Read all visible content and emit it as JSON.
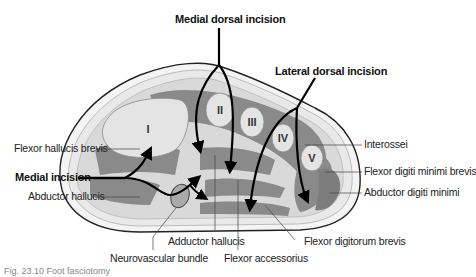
{
  "figure": {
    "caption": "Fig. 23.10 Foot fasciotomy",
    "colors": {
      "background": "#ffffff",
      "bone": "#e4e4e4",
      "muscle": "#8a8a8a",
      "fascia": "#f2f2f2",
      "skin_outline": "#222222",
      "incision_arrow": "#000000",
      "label_text": "#222222"
    },
    "bones": [
      {
        "id": "I",
        "label": "I"
      },
      {
        "id": "II",
        "label": "II"
      },
      {
        "id": "III",
        "label": "III"
      },
      {
        "id": "IV",
        "label": "IV"
      },
      {
        "id": "V",
        "label": "V"
      }
    ],
    "incisions": [
      {
        "id": "medial-dorsal",
        "label": "Medial dorsal incision"
      },
      {
        "id": "lateral-dorsal",
        "label": "Lateral dorsal incision"
      },
      {
        "id": "medial",
        "label": "Medial incision"
      }
    ],
    "labels": {
      "flexor_hallucis_brevis": "Flexor hallucis brevis",
      "abductor_hallucis": "Abductor hallucis",
      "neurovascular_bundle": "Neurovascular bundle",
      "adductor_hallucis": "Adductor hallucis",
      "flexor_accessorius": "Flexor accessorius",
      "flexor_digitorum_brevis": "Flexor digitorum brevis",
      "interossei": "Interossei",
      "flexor_digiti_minimi_brevis": "Flexor digiti minimi brevis",
      "abductor_digiti_minimi": "Abductor digiti minimi"
    }
  }
}
